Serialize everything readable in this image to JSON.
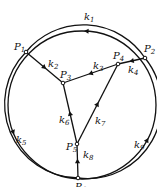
{
  "diagram": {
    "type": "directed-graph",
    "stroke_color": "#111111",
    "background": "#ffffff",
    "circle": {
      "cx": 82,
      "cy": 105,
      "r": 74
    },
    "nodes": [
      {
        "id": "P1",
        "label": "P",
        "sub": "1",
        "x": 26,
        "y": 52,
        "lx": 14,
        "ly": 50
      },
      {
        "id": "P2",
        "label": "P",
        "sub": "2",
        "x": 145,
        "y": 58,
        "lx": 144,
        "ly": 52
      },
      {
        "id": "P3",
        "label": "P",
        "sub": "3",
        "x": 63,
        "y": 83,
        "lx": 60,
        "ly": 78
      },
      {
        "id": "P4",
        "label": "P",
        "sub": "4",
        "x": 118,
        "y": 64,
        "lx": 113,
        "ly": 59
      },
      {
        "id": "P5",
        "label": "P",
        "sub": "5",
        "x": 77,
        "y": 144,
        "lx": 66,
        "ly": 150
      },
      {
        "id": "P6",
        "label": "P",
        "sub": "6",
        "x": 78,
        "y": 178,
        "lx": 75,
        "ly": 190
      }
    ],
    "edges": [
      {
        "id": "k1",
        "label": "k",
        "sub": "1",
        "from": "P2",
        "to": "P1",
        "kind": "arc",
        "lx": 84,
        "ly": 20
      },
      {
        "id": "k2",
        "label": "k",
        "sub": "2",
        "from": "P1",
        "to": "P3",
        "kind": "line",
        "lx": 48,
        "ly": 67
      },
      {
        "id": "k3",
        "label": "k",
        "sub": "3",
        "from": "P4",
        "to": "P3",
        "kind": "line",
        "lx": 93,
        "ly": 69
      },
      {
        "id": "k4",
        "label": "k",
        "sub": "4",
        "from": "P2",
        "to": "P4",
        "kind": "line",
        "lx": 128,
        "ly": 73
      },
      {
        "id": "k5",
        "label": "k",
        "sub": "5",
        "from": "P1",
        "to": "P6",
        "kind": "arc",
        "lx": 16,
        "ly": 143
      },
      {
        "id": "k6",
        "label": "k",
        "sub": "6",
        "from": "P5",
        "to": "P3",
        "kind": "line",
        "lx": 59,
        "ly": 123
      },
      {
        "id": "k7",
        "label": "k",
        "sub": "7",
        "from": "P5",
        "to": "P4",
        "kind": "line",
        "lx": 95,
        "ly": 124
      },
      {
        "id": "k8",
        "label": "k",
        "sub": "8",
        "from": "P6",
        "to": "P5",
        "kind": "line",
        "lx": 83,
        "ly": 158
      },
      {
        "id": "k9",
        "label": "k",
        "sub": "9",
        "from": "P6",
        "to": "P2",
        "kind": "arc",
        "lx": 134,
        "ly": 148
      }
    ]
  }
}
